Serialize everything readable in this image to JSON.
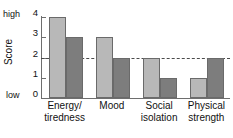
{
  "chart_data": {
    "type": "bar",
    "title": "",
    "xlabel": "",
    "ylabel": "Score",
    "ylim": [
      0,
      4
    ],
    "yticks": [
      0,
      1,
      2,
      3,
      4
    ],
    "ytick_labels": [
      "0",
      "1",
      "2",
      "3",
      "4"
    ],
    "axis_high_label": "high",
    "axis_low_label": "low",
    "grid": false,
    "legend_position": "none",
    "categories": [
      "Energy/ tiredness",
      "Mood",
      "Social isolation",
      "Physical strength"
    ],
    "category_lines": [
      [
        "Energy/",
        "tiredness"
      ],
      [
        "Mood",
        ""
      ],
      [
        "Social",
        "isolation"
      ],
      [
        "Physical",
        "strength"
      ]
    ],
    "series": [
      {
        "name": "light-series",
        "color": "#b8b8b8",
        "values": [
          4,
          3,
          2,
          1
        ]
      },
      {
        "name": "dark-series",
        "color": "#7d7d7d",
        "values": [
          3,
          2,
          1,
          2
        ]
      }
    ],
    "annotations": [
      {
        "type": "threshold-line",
        "value": 2,
        "style": "dashed",
        "color": "#4a4a4a"
      }
    ],
    "colors": {
      "light_bar": "#b8b8b8",
      "dark_bar": "#7d7d7d",
      "bar_outline": "#6a6a6a",
      "axis": "#6e6e6e",
      "threshold": "#4a4a4a",
      "background": "#ffffff",
      "text": "#111111"
    }
  }
}
